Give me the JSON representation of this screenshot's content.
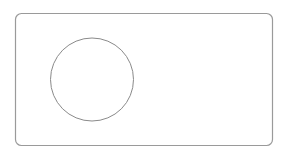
{
  "diagram": {
    "background": "#ffffff",
    "frame": {
      "shape": "rounded-rectangle",
      "x": 15.5,
      "y": 13.5,
      "width": 257,
      "height": 132,
      "rx": 6,
      "stroke": "#9a9a9a",
      "stroke_width": 1.2,
      "fill": "none"
    },
    "circle": {
      "shape": "circle",
      "cx": 92,
      "cy": 79.5,
      "r": 41.5,
      "stroke": "#8a8a8a",
      "stroke_width": 1,
      "fill": "none"
    }
  }
}
